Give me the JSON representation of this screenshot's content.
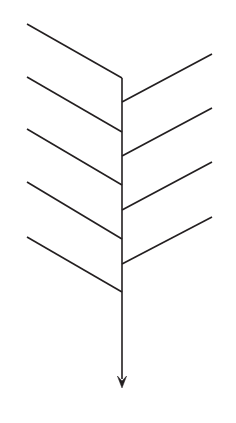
{
  "diagram": {
    "title": "",
    "type": "fishbone-skeleton",
    "canvas": {
      "width": 236,
      "height": 423,
      "background": "#ffffff"
    },
    "style": {
      "line_color": "#231f20",
      "line_width": 1.6,
      "arrow_fill": "#231f20"
    },
    "spine": {
      "label": "",
      "x": 122,
      "y_top": 78,
      "y_tip": 388,
      "arrow_head_half_width": 4.6,
      "arrow_head_length": 12,
      "direction": "down"
    },
    "left_bones": [
      {
        "label": "",
        "x1": 27,
        "y1": 24,
        "x2": 122,
        "y2": 78
      },
      {
        "label": "",
        "x1": 27,
        "y1": 77,
        "x2": 122,
        "y2": 132
      },
      {
        "label": "",
        "x1": 27,
        "y1": 129,
        "x2": 122,
        "y2": 185
      },
      {
        "label": "",
        "x1": 27,
        "y1": 182,
        "x2": 122,
        "y2": 239
      },
      {
        "label": "",
        "x1": 27,
        "y1": 237,
        "x2": 122,
        "y2": 292
      }
    ],
    "right_bones": [
      {
        "label": "",
        "x1": 212,
        "y1": 54,
        "x2": 122,
        "y2": 102
      },
      {
        "label": "",
        "x1": 212,
        "y1": 108,
        "x2": 122,
        "y2": 156
      },
      {
        "label": "",
        "x1": 212,
        "y1": 162,
        "x2": 122,
        "y2": 210
      },
      {
        "label": "",
        "x1": 212,
        "y1": 217,
        "x2": 122,
        "y2": 264
      }
    ]
  }
}
